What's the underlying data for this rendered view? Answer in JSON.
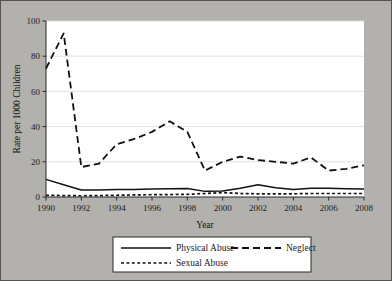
{
  "chart_data": {
    "type": "line",
    "title": "",
    "subtitle": "",
    "xlabel": "Year",
    "ylabel": "Rate per 1000 Children",
    "xlim": [
      1990,
      2008
    ],
    "ylim": [
      0,
      100
    ],
    "grid": "horizontal",
    "legend_position": "bottom",
    "x": [
      1990,
      1991,
      1992,
      1993,
      1994,
      1995,
      1996,
      1997,
      1998,
      1999,
      2000,
      2001,
      2002,
      2003,
      2004,
      2005,
      2006,
      2007,
      2008
    ],
    "xtick_labels": [
      "1990",
      "1992",
      "1994",
      "1996",
      "1998",
      "2000",
      "2002",
      "2004",
      "2006",
      "2008"
    ],
    "xticks": [
      1990,
      1992,
      1994,
      1996,
      1998,
      2000,
      2002,
      2004,
      2006,
      2008
    ],
    "ytick_labels": [
      "0",
      "20",
      "40",
      "60",
      "80",
      "100"
    ],
    "yticks": [
      0,
      20,
      40,
      60,
      80,
      100
    ],
    "series": [
      {
        "name": "Physical Abuse",
        "style": "solid",
        "color": "#111111",
        "values": [
          10.0,
          7.0,
          4.0,
          4.0,
          4.2,
          4.3,
          4.5,
          4.7,
          4.8,
          3.2,
          3.4,
          5.0,
          7.0,
          5.3,
          4.2,
          5.0,
          5.0,
          4.7,
          4.5
        ]
      },
      {
        "name": "Neglect",
        "style": "long-dash",
        "color": "#111111",
        "values": [
          73.0,
          93.0,
          17.0,
          19.0,
          30.0,
          33.0,
          37.0,
          43.0,
          37.0,
          15.0,
          20.0,
          23.0,
          21.0,
          20.0,
          19.0,
          22.5,
          15.0,
          16.0,
          18.0
        ]
      },
      {
        "name": "Sexual Abuse",
        "style": "short-dash",
        "color": "#111111",
        "values": [
          1.0,
          0.8,
          0.7,
          0.8,
          1.0,
          1.2,
          1.3,
          1.4,
          1.5,
          2.0,
          2.5,
          2.0,
          1.8,
          1.8,
          1.8,
          2.0,
          2.0,
          2.0,
          2.0
        ]
      }
    ]
  },
  "legend": {
    "items": [
      {
        "label": "Physical Abuse",
        "style": "solid"
      },
      {
        "label": "Neglect",
        "style": "long-dash"
      },
      {
        "label": "Sexual Abuse",
        "style": "short-dash"
      }
    ]
  }
}
